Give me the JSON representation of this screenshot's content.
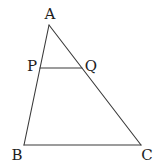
{
  "diagram": {
    "type": "triangle-with-parallel-segment",
    "points": {
      "A": {
        "label": "A",
        "x": 49,
        "y": 25,
        "label_x": 50,
        "label_y": 19
      },
      "B": {
        "label": "B",
        "x": 24,
        "y": 145,
        "label_x": 17,
        "label_y": 160
      },
      "C": {
        "label": "C",
        "x": 141,
        "y": 145,
        "label_x": 147,
        "label_y": 160
      },
      "P": {
        "label": "P",
        "x": 40,
        "y": 68,
        "label_x": 32,
        "label_y": 71
      },
      "Q": {
        "label": "Q",
        "x": 82,
        "y": 68,
        "label_x": 90,
        "label_y": 71
      }
    },
    "segments": [
      {
        "from": "A",
        "to": "B"
      },
      {
        "from": "A",
        "to": "C"
      },
      {
        "from": "B",
        "to": "C"
      },
      {
        "from": "P",
        "to": "Q"
      }
    ],
    "stroke_color": "#3a3a3a",
    "label_color": "#1e1e1e"
  }
}
